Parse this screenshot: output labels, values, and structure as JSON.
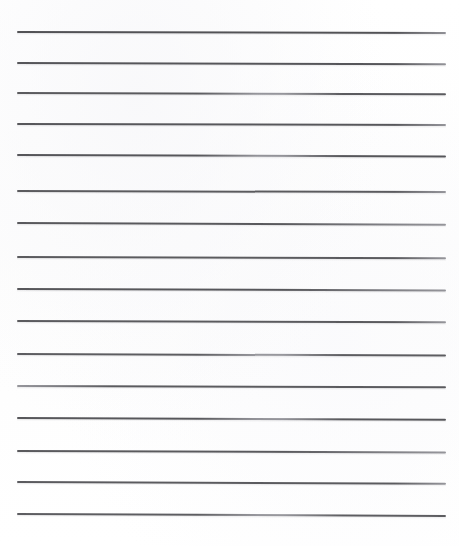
{
  "document": {
    "kind": "scanned-ruled-paper",
    "title": "Ruled Paper Scan",
    "page_width": 459,
    "page_height": 546,
    "background_color": "#fefefe",
    "ink_color": "#4a4a4e",
    "ink_color_light": "#8c8c92",
    "content_text": "",
    "line_count": 16,
    "margins": {
      "left": 17,
      "right": 14,
      "top": 31,
      "bottom": 32
    },
    "lines": [
      {
        "index": 1,
        "y": 31,
        "x_start": 17,
        "x_end": 446,
        "thickness": 1.9,
        "tilt_deg": 0.13,
        "opacity": 0.95,
        "fade": "none"
      },
      {
        "index": 2,
        "y": 62,
        "x_start": 17,
        "x_end": 446,
        "thickness": 1.8,
        "tilt_deg": 0.16,
        "opacity": 0.93,
        "fade": "none"
      },
      {
        "index": 3,
        "y": 92,
        "x_start": 17,
        "x_end": 446,
        "thickness": 1.6,
        "tilt_deg": 0.18,
        "opacity": 0.9,
        "fade": "mid"
      },
      {
        "index": 4,
        "y": 123,
        "x_start": 17,
        "x_end": 446,
        "thickness": 1.7,
        "tilt_deg": 0.14,
        "opacity": 0.92,
        "fade": "none"
      },
      {
        "index": 5,
        "y": 154,
        "x_start": 17,
        "x_end": 446,
        "thickness": 1.8,
        "tilt_deg": 0.2,
        "opacity": 0.93,
        "fade": "mid"
      },
      {
        "index": 6,
        "y": 190,
        "x_start": 17,
        "x_end": 446,
        "thickness": 1.6,
        "tilt_deg": 0.15,
        "opacity": 0.9,
        "fade": "none"
      },
      {
        "index": 7,
        "y": 222,
        "x_start": 17,
        "x_end": 446,
        "thickness": 1.7,
        "tilt_deg": 0.22,
        "opacity": 0.91,
        "fade": "right"
      },
      {
        "index": 8,
        "y": 256,
        "x_start": 17,
        "x_end": 446,
        "thickness": 1.6,
        "tilt_deg": 0.17,
        "opacity": 0.9,
        "fade": "none"
      },
      {
        "index": 9,
        "y": 288,
        "x_start": 17,
        "x_end": 446,
        "thickness": 1.7,
        "tilt_deg": 0.19,
        "opacity": 0.92,
        "fade": "right"
      },
      {
        "index": 10,
        "y": 320,
        "x_start": 17,
        "x_end": 446,
        "thickness": 1.6,
        "tilt_deg": 0.16,
        "opacity": 0.9,
        "fade": "none"
      },
      {
        "index": 11,
        "y": 353,
        "x_start": 17,
        "x_end": 446,
        "thickness": 1.6,
        "tilt_deg": 0.21,
        "opacity": 0.89,
        "fade": "mid"
      },
      {
        "index": 12,
        "y": 385,
        "x_start": 17,
        "x_end": 446,
        "thickness": 1.6,
        "tilt_deg": 0.18,
        "opacity": 0.9,
        "fade": "left"
      },
      {
        "index": 13,
        "y": 417,
        "x_start": 17,
        "x_end": 446,
        "thickness": 1.8,
        "tilt_deg": 0.24,
        "opacity": 0.92,
        "fade": "mid"
      },
      {
        "index": 14,
        "y": 450,
        "x_start": 17,
        "x_end": 446,
        "thickness": 1.7,
        "tilt_deg": 0.2,
        "opacity": 0.91,
        "fade": "right"
      },
      {
        "index": 15,
        "y": 481,
        "x_start": 17,
        "x_end": 446,
        "thickness": 1.6,
        "tilt_deg": 0.23,
        "opacity": 0.9,
        "fade": "none"
      },
      {
        "index": 16,
        "y": 513,
        "x_start": 17,
        "x_end": 446,
        "thickness": 1.6,
        "tilt_deg": 0.26,
        "opacity": 0.89,
        "fade": "mid"
      }
    ]
  }
}
